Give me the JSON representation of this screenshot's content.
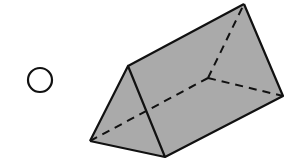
{
  "diagram": {
    "type": "answer-choice",
    "choice_marker": "radio-button (unselected)",
    "shape": "triangular prism",
    "colors": {
      "face_fill": "#aaaaaa",
      "edge": "#111111",
      "background": "#ffffff"
    },
    "vertices": {
      "front_top": [
        128,
        66
      ],
      "front_bottom_left": [
        90,
        141
      ],
      "front_bottom_right": [
        165,
        157
      ],
      "back_top": [
        244,
        4
      ],
      "back_bottom_right": [
        283,
        96
      ],
      "back_bottom_left_hidden": [
        208,
        78
      ]
    }
  }
}
